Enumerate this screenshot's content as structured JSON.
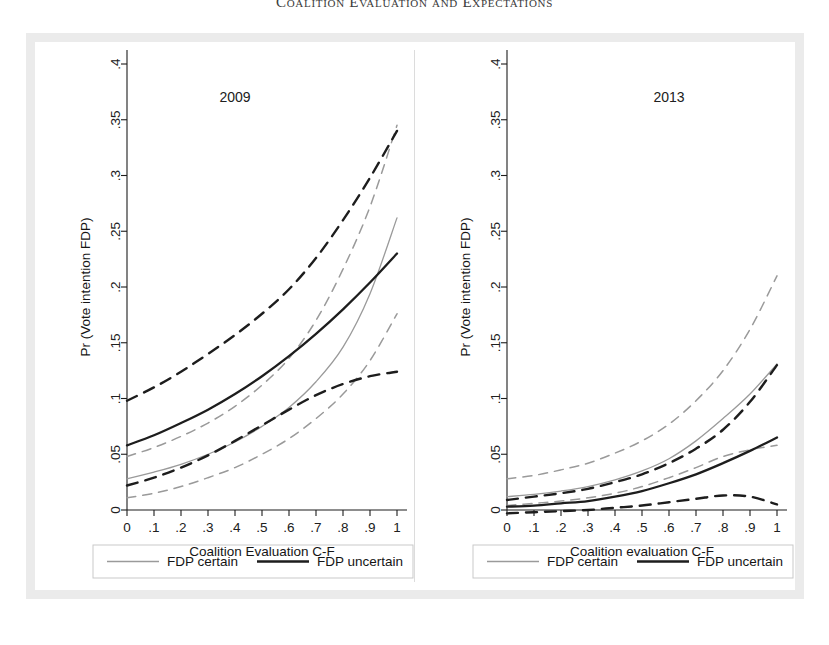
{
  "running_head": "Coalition Evaluation and Expectations",
  "figure": {
    "y_axis_label": "Pr (Vote intention FDP)",
    "y_ticks": [
      "0",
      ".05",
      ".1",
      ".15",
      ".2",
      ".25",
      ".3",
      ".35",
      ".4"
    ],
    "y_tick_values": [
      0,
      0.05,
      0.1,
      0.15,
      0.2,
      0.25,
      0.3,
      0.35,
      0.4
    ],
    "x_ticks": [
      "0",
      ".1",
      ".2",
      ".3",
      ".4",
      ".5",
      ".6",
      ".7",
      ".8",
      ".9",
      "1"
    ],
    "x_tick_values": [
      0,
      0.1,
      0.2,
      0.3,
      0.4,
      0.5,
      0.6,
      0.7,
      0.8,
      0.9,
      1
    ],
    "legend": {
      "certain_label": "FDP certain",
      "uncertain_label": "FDP uncertain",
      "certain_color": "#9a9a9a",
      "uncertain_color": "#1d1d1d"
    }
  },
  "chart_data": [
    {
      "type": "line",
      "panel": "left",
      "title": "2009",
      "xlabel": "Coalition Evaluation C-F",
      "ylabel": "Pr (Vote intention FDP)",
      "xlim": [
        0,
        1
      ],
      "ylim": [
        0,
        0.4
      ],
      "grid": false,
      "legend_position": "below",
      "x": [
        0,
        0.1,
        0.2,
        0.3,
        0.4,
        0.5,
        0.6,
        0.7,
        0.8,
        0.9,
        1
      ],
      "series": [
        {
          "name": "FDP certain",
          "style": "solid",
          "color": "#9a9a9a",
          "values": [
            0.028,
            0.034,
            0.041,
            0.05,
            0.061,
            0.075,
            0.092,
            0.115,
            0.146,
            0.194,
            0.262
          ]
        },
        {
          "name": "FDP certain CI upper",
          "style": "dashed",
          "color": "#9a9a9a",
          "values": [
            0.048,
            0.056,
            0.066,
            0.078,
            0.093,
            0.112,
            0.136,
            0.17,
            0.216,
            0.272,
            0.345
          ]
        },
        {
          "name": "FDP certain CI lower",
          "style": "dashed",
          "color": "#9a9a9a",
          "values": [
            0.011,
            0.015,
            0.021,
            0.029,
            0.038,
            0.05,
            0.064,
            0.082,
            0.104,
            0.134,
            0.176
          ]
        },
        {
          "name": "FDP uncertain",
          "style": "solid",
          "color": "#1d1d1d",
          "values": [
            0.058,
            0.067,
            0.078,
            0.09,
            0.104,
            0.12,
            0.138,
            0.158,
            0.18,
            0.204,
            0.23
          ]
        },
        {
          "name": "FDP uncertain CI upper",
          "style": "dashed",
          "color": "#1d1d1d",
          "values": [
            0.098,
            0.11,
            0.124,
            0.14,
            0.157,
            0.176,
            0.198,
            0.226,
            0.26,
            0.298,
            0.34
          ]
        },
        {
          "name": "FDP uncertain CI lower",
          "style": "dashed",
          "color": "#1d1d1d",
          "values": [
            0.022,
            0.029,
            0.038,
            0.049,
            0.062,
            0.076,
            0.09,
            0.103,
            0.113,
            0.12,
            0.124
          ]
        }
      ]
    },
    {
      "type": "line",
      "panel": "right",
      "title": "2013",
      "xlabel": "Coalition evaluation C-F",
      "ylabel": "Pr (Vote intention FDP)",
      "xlim": [
        0,
        1
      ],
      "ylim": [
        0,
        0.4
      ],
      "grid": false,
      "legend_position": "below",
      "x": [
        0,
        0.1,
        0.2,
        0.3,
        0.4,
        0.5,
        0.6,
        0.7,
        0.8,
        0.9,
        1
      ],
      "series": [
        {
          "name": "FDP certain",
          "style": "solid",
          "color": "#9a9a9a",
          "values": [
            0.012,
            0.014,
            0.017,
            0.021,
            0.027,
            0.035,
            0.046,
            0.062,
            0.082,
            0.104,
            0.131
          ]
        },
        {
          "name": "FDP certain CI upper",
          "style": "dashed",
          "color": "#9a9a9a",
          "values": [
            0.028,
            0.031,
            0.036,
            0.042,
            0.051,
            0.062,
            0.077,
            0.098,
            0.125,
            0.162,
            0.21
          ]
        },
        {
          "name": "FDP certain CI lower",
          "style": "dashed",
          "color": "#9a9a9a",
          "values": [
            0.004,
            0.006,
            0.008,
            0.011,
            0.015,
            0.021,
            0.029,
            0.038,
            0.048,
            0.054,
            0.058
          ]
        },
        {
          "name": "FDP uncertain",
          "style": "solid",
          "color": "#1d1d1d",
          "values": [
            0.003,
            0.004,
            0.006,
            0.008,
            0.012,
            0.017,
            0.024,
            0.032,
            0.042,
            0.053,
            0.065
          ]
        },
        {
          "name": "FDP uncertain CI upper",
          "style": "dashed",
          "color": "#1d1d1d",
          "values": [
            0.009,
            0.012,
            0.015,
            0.019,
            0.025,
            0.032,
            0.042,
            0.055,
            0.072,
            0.097,
            0.13
          ]
        },
        {
          "name": "FDP uncertain CI lower",
          "style": "dashed",
          "color": "#1d1d1d",
          "values": [
            -0.003,
            -0.002,
            -0.001,
            0.0,
            0.002,
            0.004,
            0.007,
            0.01,
            0.013,
            0.012,
            0.005
          ]
        }
      ]
    }
  ]
}
